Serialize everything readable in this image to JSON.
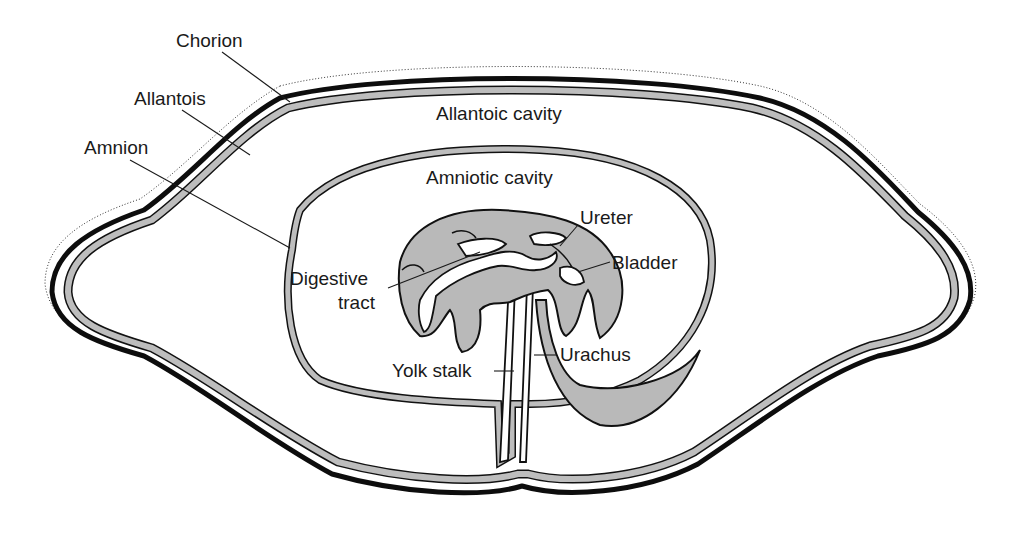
{
  "figure": {
    "colors": {
      "background": "#ffffff",
      "membrane_fill": "#bdbdbd",
      "outline": "#111111",
      "text": "#1a1a1a"
    },
    "labels": {
      "chorion": "Chorion",
      "allantois": "Allantois",
      "amnion": "Amnion",
      "allantoic_cavity": "Allantoic cavity",
      "amniotic_cavity": "Amniotic cavity",
      "digestive_tract_line1": "Digestive",
      "digestive_tract_line2": "tract",
      "ureter": "Ureter",
      "bladder": "Bladder",
      "urachus": "Urachus",
      "yolk_stalk": "Yolk stalk"
    }
  }
}
